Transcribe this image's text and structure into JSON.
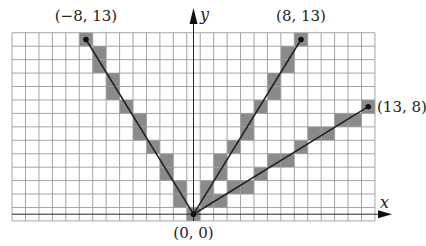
{
  "diagram": {
    "grid": {
      "x_min": -13.5,
      "x_max": 13.5,
      "y_min": -0.5,
      "y_max": 13.5,
      "unit_px": 13.44,
      "origin_px": [
        193.5,
        214.2
      ],
      "line_color": "#9a9a9a",
      "cell_fill": "#8a8a8a"
    },
    "axes": {
      "x_label": "x",
      "y_label": "y",
      "color": "#222222"
    },
    "origin": {
      "label": "(0, 0)",
      "x": 0,
      "y": 0
    },
    "segments": [
      {
        "name": "segment-to-neg8-13",
        "from": [
          0,
          0
        ],
        "to": [
          -8,
          13
        ],
        "label": "(−8, 13)"
      },
      {
        "name": "segment-to-8-13",
        "from": [
          0,
          0
        ],
        "to": [
          8,
          13
        ],
        "label": "(8, 13)"
      },
      {
        "name": "segment-to-13-8",
        "from": [
          0,
          0
        ],
        "to": [
          13,
          8
        ],
        "label": "(13, 8)"
      }
    ],
    "shaded_cells": {
      "segment-to-neg8-13": [
        [
          0,
          0
        ],
        [
          -1,
          1
        ],
        [
          -1,
          2
        ],
        [
          -2,
          3
        ],
        [
          -2,
          4
        ],
        [
          -3,
          5
        ],
        [
          -4,
          6
        ],
        [
          -4,
          7
        ],
        [
          -5,
          8
        ],
        [
          -6,
          9
        ],
        [
          -6,
          10
        ],
        [
          -7,
          11
        ],
        [
          -7,
          12
        ],
        [
          -8,
          13
        ]
      ],
      "segment-to-8-13": [
        [
          0,
          0
        ],
        [
          1,
          1
        ],
        [
          1,
          2
        ],
        [
          2,
          3
        ],
        [
          2,
          4
        ],
        [
          3,
          5
        ],
        [
          4,
          6
        ],
        [
          4,
          7
        ],
        [
          5,
          8
        ],
        [
          6,
          9
        ],
        [
          6,
          10
        ],
        [
          7,
          11
        ],
        [
          7,
          12
        ],
        [
          8,
          13
        ]
      ],
      "segment-to-13-8": [
        [
          0,
          0
        ],
        [
          1,
          1
        ],
        [
          2,
          1
        ],
        [
          3,
          2
        ],
        [
          4,
          2
        ],
        [
          5,
          3
        ],
        [
          6,
          4
        ],
        [
          7,
          4
        ],
        [
          8,
          5
        ],
        [
          9,
          6
        ],
        [
          10,
          6
        ],
        [
          11,
          7
        ],
        [
          12,
          7
        ],
        [
          13,
          8
        ]
      ]
    }
  }
}
